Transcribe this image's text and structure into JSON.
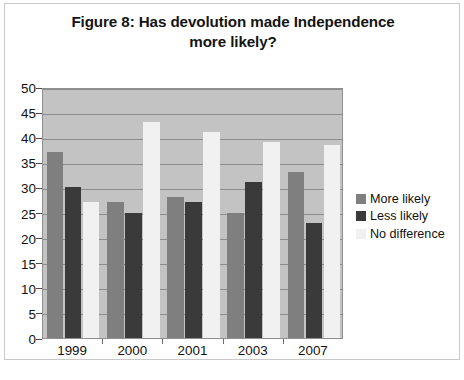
{
  "figure": {
    "title_line1": "Figure 8: Has devolution made Independence",
    "title_line2": "more likely?"
  },
  "chart_data": {
    "type": "bar",
    "title": "Figure 8: Has devolution made Independence more likely?",
    "xlabel": "",
    "ylabel": "",
    "ylim": [
      0,
      50
    ],
    "ytick_step": 5,
    "yticks": [
      50,
      45,
      40,
      35,
      30,
      25,
      20,
      15,
      10,
      5,
      0
    ],
    "grid": true,
    "legend_position": "right",
    "categories": [
      "1999",
      "2000",
      "2001",
      "2003",
      "2007"
    ],
    "series": [
      {
        "name": "More likely",
        "color": "#7f7f7f",
        "values": [
          37,
          27,
          28,
          25,
          33
        ]
      },
      {
        "name": "Less likely",
        "color": "#3a3a3a",
        "values": [
          30,
          25,
          27,
          31,
          23
        ]
      },
      {
        "name": "No difference",
        "color": "#f1f1f1",
        "values": [
          27,
          43,
          41,
          39,
          38.5
        ]
      }
    ]
  },
  "legend": {
    "items": [
      {
        "label": "More likely",
        "color": "#7f7f7f"
      },
      {
        "label": "Less likely",
        "color": "#3a3a3a"
      },
      {
        "label": "No difference",
        "color": "#f1f1f1"
      }
    ]
  }
}
